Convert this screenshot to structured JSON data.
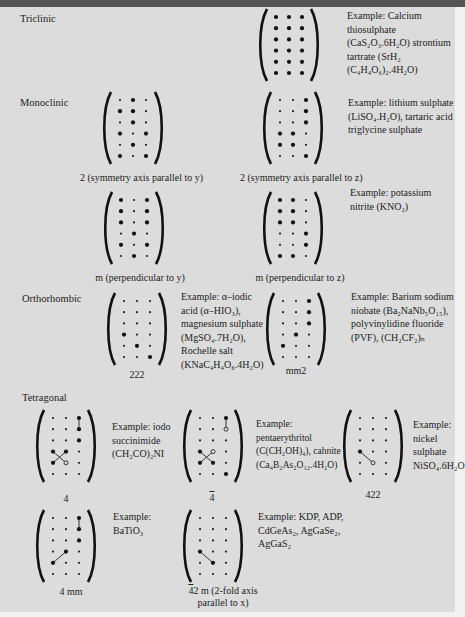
{
  "sections": {
    "triclinic": "Triclinic",
    "monoclinic": "Monoclinic",
    "orthorhombic": "Orthorhombic",
    "tetragonal": "Tetragonal"
  },
  "legend": {
    "L": "large-dot (nonzero coefficient)",
    "s": "small-dot (zero coefficient)",
    "O": "open-circle (equal magnitude, opposite sign)"
  },
  "matrices": [
    {
      "id": "triclinic-1",
      "class": "1",
      "caption": "",
      "rows": [
        "LLL",
        "LLL",
        "LLL",
        "LLL",
        "LLL",
        "LLL"
      ],
      "lines": [],
      "example": "Example: Calcium thiosulphate (CaS₂O₃.6H₂O) strontium tartrate (SrH₂ (C₄H₄O₆)₂.4H₂O)"
    },
    {
      "id": "mono-2y",
      "class": "2",
      "caption": "2 (symmetry axis parallel to y)",
      "rows": [
        "sLs",
        "LLs",
        "sLs",
        "LsL",
        "sLs",
        "LsL"
      ],
      "lines": []
    },
    {
      "id": "mono-2z",
      "class": "2",
      "caption": "2 (symmetry axis parallel to z)",
      "rows": [
        "ssL",
        "ssL",
        "ssL",
        "LLs",
        "LLs",
        "ssL"
      ],
      "lines": [],
      "example": "Example: lithium sulphate (LiSO₄.H₂O), tartaric acid triglycine sulphate"
    },
    {
      "id": "mono-my",
      "class": "m",
      "caption": "m (perpendicular to y)",
      "rows": [
        "LsL",
        "LsL",
        "LsL",
        "sLs",
        "LsL",
        "sLs"
      ],
      "lines": []
    },
    {
      "id": "mono-mz",
      "class": "m",
      "caption": "m (perpendicular to z)",
      "rows": [
        "LLs",
        "LLs",
        "LLs",
        "ssL",
        "ssL",
        "LLs"
      ],
      "lines": [],
      "example": "Example: potassium nitrite (KNO₂)"
    },
    {
      "id": "ortho-222",
      "class": "222",
      "caption": "222",
      "rows": [
        "sss",
        "sss",
        "sss",
        "Lss",
        "sLs",
        "ssL"
      ],
      "lines": [],
      "example": "Example: α–iodic acid (α–HIO₃), magnesium sulphate (MgSO₄.7H₂O), Rochelle salt (KNaC₄H₄O₆.4H₂O)"
    },
    {
      "id": "ortho-mm2",
      "class": "mm2",
      "caption": "mm2",
      "rows": [
        "ssL",
        "ssL",
        "ssL",
        "sLs",
        "Lss",
        "sss"
      ],
      "lines": [],
      "example": "Example: Barium sodium niobate (Ba₂NaNb₅O₁₅), polyvinylidine fluoride (PVF), (CH₂CF₂)ₙ"
    },
    {
      "id": "tetra-4",
      "class": "4",
      "caption": "4",
      "rows": [
        "ssL",
        "ssL",
        "ssL",
        "LLs",
        "LOs",
        "sss"
      ],
      "lines": [
        [
          0,
          2,
          1,
          2
        ],
        [
          3,
          0,
          4,
          1
        ],
        [
          3,
          1,
          4,
          0
        ]
      ],
      "example": "Example: iodo succinimide (CH₂CO)₂NI"
    },
    {
      "id": "tetra-4bar",
      "class": "4̄",
      "caption": "4̄",
      "rows": [
        "ssL",
        "ssO",
        "sss",
        "LOs",
        "LLs",
        "ssL"
      ],
      "lines": [
        [
          0,
          2,
          1,
          2
        ],
        [
          3,
          0,
          4,
          1
        ],
        [
          3,
          1,
          4,
          0
        ]
      ],
      "example": "Example: pentaerythritol (C(CH₂OH)₄), cahnite (Ca₄B₂As₂O₁₂.4H₂O)"
    },
    {
      "id": "tetra-422",
      "class": "422",
      "caption": "422",
      "rows": [
        "sss",
        "sss",
        "sss",
        "Lss",
        "sOs",
        "sss"
      ],
      "lines": [
        [
          3,
          0,
          4,
          1
        ]
      ],
      "example": "Example: nickel sulphate NiSO₄.6H₂O"
    },
    {
      "id": "tetra-4mm",
      "class": "4mm",
      "caption": "4 mm",
      "rows": [
        "ssL",
        "ssL",
        "ssL",
        "sLs",
        "Lss",
        "sss"
      ],
      "lines": [
        [
          0,
          2,
          1,
          2
        ],
        [
          4,
          0,
          3,
          1
        ]
      ],
      "example": "Example: BaTiO₃"
    },
    {
      "id": "tetra-42m",
      "class": "4̄2m",
      "caption": "4̄2 m (2-fold axis parallel to x)",
      "caption_line1": "4̄2 m (2-fold axis",
      "caption_line2": "parallel to x)",
      "rows": [
        "sss",
        "sss",
        "sss",
        "Lss",
        "sLs",
        "sss"
      ],
      "lines": [
        [
          3,
          0,
          4,
          1
        ]
      ],
      "example": "Example: KDP, ADP, CdGeAs₂, AgGaSe₂, AgGaS₂"
    }
  ],
  "captions": {
    "mono_2y": "2 (symmetry axis parallel to y)",
    "mono_2z": "2 (symmetry axis parallel to z)",
    "mono_my": "m (perpendicular to y)",
    "mono_mz": "m (perpendicular to z)",
    "ortho_222": "222",
    "ortho_mm2": "mm2",
    "tetra_4": "4",
    "tetra_4bar": "4",
    "tetra_422": "422",
    "tetra_4mm": "4 mm",
    "tetra_42m_1": "42 m (2-fold axis",
    "tetra_42m_2": "parallel to x)"
  }
}
